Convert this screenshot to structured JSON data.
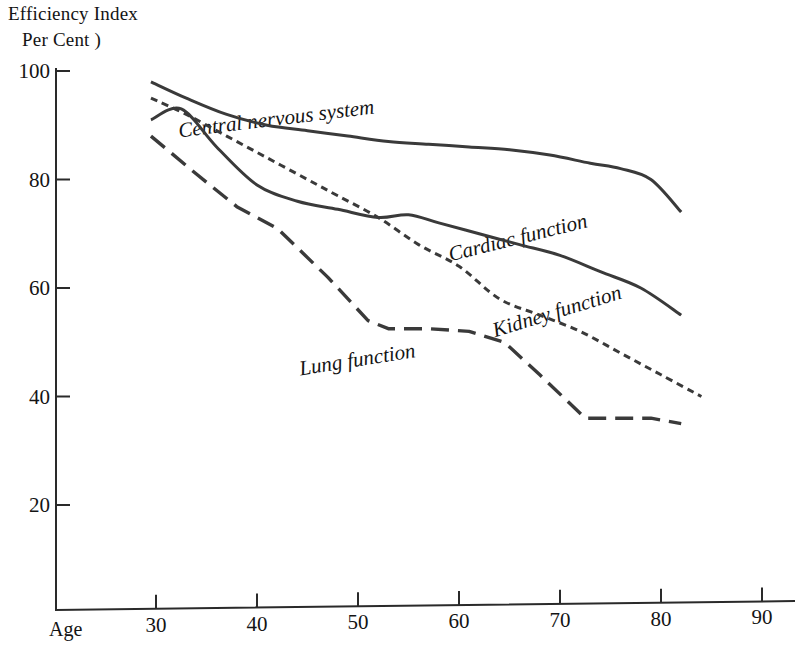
{
  "chart_data": {
    "type": "line",
    "title": "Efficiency Index",
    "subtitle": "Per Cent )",
    "xlabel": "Age",
    "ylabel": "Efficiency Index ( Per Cent )",
    "xlim": [
      25,
      90
    ],
    "ylim": [
      0,
      100
    ],
    "grid": false,
    "legend": "inline-labels",
    "x_ticks": [
      "30",
      "40",
      "50",
      "60",
      "70",
      "80",
      "90"
    ],
    "x_tick_values": [
      30,
      40,
      50,
      60,
      70,
      80,
      90
    ],
    "y_ticks": [
      "100",
      "80",
      "60",
      "40",
      "20"
    ],
    "y_tick_values": [
      100,
      80,
      60,
      40,
      20
    ],
    "series": [
      {
        "name": "Central nervous system",
        "style": "solid",
        "color": "#3a3a3a",
        "x": [
          29.5,
          33,
          37,
          41,
          45,
          49,
          53,
          57,
          61,
          65,
          69,
          73,
          76,
          79,
          82
        ],
        "values": [
          98,
          95,
          92,
          90,
          89,
          88,
          87,
          86.5,
          86,
          85.5,
          84.5,
          83,
          82,
          80,
          74
        ]
      },
      {
        "name": "Cardiac function",
        "style": "solid",
        "color": "#3a3a3a",
        "x": [
          29.5,
          32.5,
          36,
          40,
          44,
          48,
          52,
          55,
          58,
          62,
          66,
          70,
          74,
          78,
          82
        ],
        "values": [
          91,
          93,
          86,
          79,
          76,
          74.5,
          73,
          73.5,
          72,
          70,
          68,
          66,
          63,
          60,
          55
        ]
      },
      {
        "name": "Kidney function",
        "style": "dotted",
        "color": "#3a3a3a",
        "x": [
          29.5,
          33,
          37,
          41,
          45,
          48,
          52,
          56,
          60,
          64,
          68,
          72,
          76,
          80,
          84
        ],
        "values": [
          95,
          92,
          88,
          84,
          80,
          77,
          73,
          68,
          64,
          58,
          55,
          52,
          48,
          44,
          40
        ]
      },
      {
        "name": "Lung function",
        "style": "dashed",
        "color": "#3a3a3a",
        "x": [
          29.5,
          34,
          38,
          42,
          47,
          51,
          53,
          57,
          61,
          64.5,
          68,
          72.5,
          76,
          79,
          82
        ],
        "values": [
          88,
          81,
          75,
          71,
          62,
          54,
          52.5,
          52.5,
          52,
          50,
          44,
          36,
          36,
          36,
          35
        ]
      }
    ],
    "annotations": [
      {
        "text": "Central nervous system",
        "x": 42,
        "y": 89,
        "rotation": -7
      },
      {
        "text": "Cardiac function",
        "x": 66,
        "y": 66,
        "rotation": -14
      },
      {
        "text": "Kidney function",
        "x": 70,
        "y": 52,
        "rotation": -17
      },
      {
        "text": "Lung function",
        "x": 50,
        "y": 45,
        "rotation": -9
      }
    ]
  },
  "axes": {
    "axis_color": "#2a2a2a"
  }
}
